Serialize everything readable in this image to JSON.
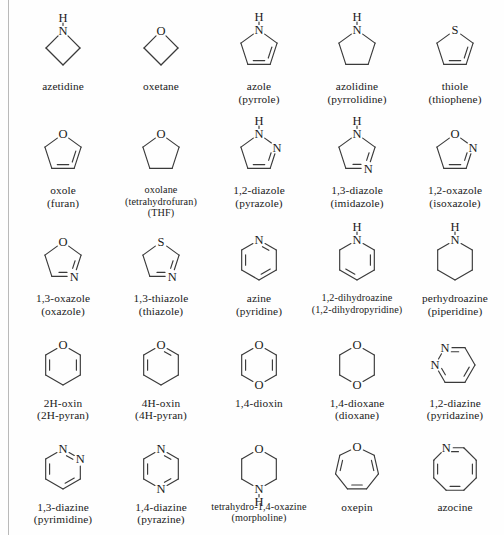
{
  "figure": {
    "type": "chemical-structure-chart",
    "columns": 5,
    "rows": 5,
    "line_color": "#3a3a3a",
    "text_color": "#1a1a1a",
    "background": "#fefefe"
  },
  "compounds": [
    {
      "id": "azetidine",
      "name_main": "azetidine",
      "name_alt": "",
      "name_alt2": "",
      "ring_size": 4,
      "ring_shape": "square-diamond",
      "heteroatoms": [
        {
          "label": "N",
          "position": "top",
          "hydrogen": "H"
        }
      ],
      "double_bonds": 0
    },
    {
      "id": "oxetane",
      "name_main": "oxetane",
      "name_alt": "",
      "name_alt2": "",
      "ring_size": 4,
      "ring_shape": "square-diamond",
      "heteroatoms": [
        {
          "label": "O",
          "position": "top",
          "hydrogen": ""
        }
      ],
      "double_bonds": 0
    },
    {
      "id": "azole",
      "name_main": "azole",
      "name_alt": "(pyrrole)",
      "name_alt2": "",
      "ring_size": 5,
      "ring_shape": "pentagon",
      "heteroatoms": [
        {
          "label": "N",
          "position": "top",
          "hydrogen": "H"
        }
      ],
      "double_bonds": 2
    },
    {
      "id": "azolidine",
      "name_main": "azolidine",
      "name_alt": "(pyrrolidine)",
      "name_alt2": "",
      "ring_size": 5,
      "ring_shape": "pentagon",
      "heteroatoms": [
        {
          "label": "N",
          "position": "top",
          "hydrogen": "H"
        }
      ],
      "double_bonds": 0
    },
    {
      "id": "thiole",
      "name_main": "thiole",
      "name_alt": "(thiophene)",
      "name_alt2": "",
      "ring_size": 5,
      "ring_shape": "pentagon",
      "heteroatoms": [
        {
          "label": "S",
          "position": "top",
          "hydrogen": ""
        }
      ],
      "double_bonds": 2
    },
    {
      "id": "oxole",
      "name_main": "oxole",
      "name_alt": "(furan)",
      "name_alt2": "",
      "ring_size": 5,
      "ring_shape": "pentagon",
      "heteroatoms": [
        {
          "label": "O",
          "position": "top",
          "hydrogen": ""
        }
      ],
      "double_bonds": 2
    },
    {
      "id": "oxolane",
      "name_main": "oxolane",
      "name_alt": "(tetrahydrofuran)",
      "name_alt2": "(THF)",
      "ring_size": 5,
      "ring_shape": "pentagon",
      "heteroatoms": [
        {
          "label": "O",
          "position": "top",
          "hydrogen": ""
        }
      ],
      "double_bonds": 0
    },
    {
      "id": "12-diazole",
      "name_main": "1,2-diazole",
      "name_alt": "(pyrazole)",
      "name_alt2": "",
      "ring_size": 5,
      "ring_shape": "pentagon",
      "heteroatoms": [
        {
          "label": "N",
          "position": "top",
          "hydrogen": "H"
        },
        {
          "label": "N",
          "position": "upper-right",
          "hydrogen": ""
        }
      ],
      "double_bonds": 2
    },
    {
      "id": "13-diazole",
      "name_main": "1,3-diazole",
      "name_alt": "(imidazole)",
      "name_alt2": "",
      "ring_size": 5,
      "ring_shape": "pentagon",
      "heteroatoms": [
        {
          "label": "N",
          "position": "top",
          "hydrogen": "H"
        },
        {
          "label": "N",
          "position": "lower-right",
          "hydrogen": ""
        }
      ],
      "double_bonds": 2
    },
    {
      "id": "12-oxazole",
      "name_main": "1,2-oxazole",
      "name_alt": "(isoxazole)",
      "name_alt2": "",
      "ring_size": 5,
      "ring_shape": "pentagon",
      "heteroatoms": [
        {
          "label": "O",
          "position": "top",
          "hydrogen": ""
        },
        {
          "label": "N",
          "position": "upper-right",
          "hydrogen": ""
        }
      ],
      "double_bonds": 2
    },
    {
      "id": "13-oxazole",
      "name_main": "1,3-oxazole",
      "name_alt": "(oxazole)",
      "name_alt2": "",
      "ring_size": 5,
      "ring_shape": "pentagon",
      "heteroatoms": [
        {
          "label": "O",
          "position": "top",
          "hydrogen": ""
        },
        {
          "label": "N",
          "position": "lower-right",
          "hydrogen": ""
        }
      ],
      "double_bonds": 2
    },
    {
      "id": "13-thiazole",
      "name_main": "1,3-thiazole",
      "name_alt": "(thiazole)",
      "name_alt2": "",
      "ring_size": 5,
      "ring_shape": "pentagon",
      "heteroatoms": [
        {
          "label": "S",
          "position": "top",
          "hydrogen": ""
        },
        {
          "label": "N",
          "position": "lower-right",
          "hydrogen": ""
        }
      ],
      "double_bonds": 2
    },
    {
      "id": "azine",
      "name_main": "azine",
      "name_alt": "(pyridine)",
      "name_alt2": "",
      "ring_size": 6,
      "ring_shape": "hexagon-pointy-top",
      "heteroatoms": [
        {
          "label": "N",
          "position": "top",
          "hydrogen": ""
        }
      ],
      "double_bonds": 3
    },
    {
      "id": "12-dihydroazine",
      "name_main": "1,2-dihydroazine",
      "name_alt": "(1,2-dihydropyridine)",
      "name_alt2": "",
      "ring_size": 6,
      "ring_shape": "hexagon-pointy-top",
      "heteroatoms": [
        {
          "label": "N",
          "position": "top",
          "hydrogen": "H"
        }
      ],
      "double_bonds": 2
    },
    {
      "id": "perhydroazine",
      "name_main": "perhydroazine",
      "name_alt": "(piperidine)",
      "name_alt2": "",
      "ring_size": 6,
      "ring_shape": "hexagon-pointy-top",
      "heteroatoms": [
        {
          "label": "N",
          "position": "top",
          "hydrogen": "H"
        }
      ],
      "double_bonds": 0
    },
    {
      "id": "2h-oxin",
      "name_main": "2H-oxin",
      "name_alt": "(2H-pyran)",
      "name_alt2": "",
      "ring_size": 6,
      "ring_shape": "hexagon-pointy-top",
      "heteroatoms": [
        {
          "label": "O",
          "position": "top",
          "hydrogen": ""
        }
      ],
      "double_bonds": 2
    },
    {
      "id": "4h-oxin",
      "name_main": "4H-oxin",
      "name_alt": "(4H-pyran)",
      "name_alt2": "",
      "ring_size": 6,
      "ring_shape": "hexagon-pointy-top",
      "heteroatoms": [
        {
          "label": "O",
          "position": "top",
          "hydrogen": ""
        }
      ],
      "double_bonds": 2
    },
    {
      "id": "14-dioxin",
      "name_main": "1,4-dioxin",
      "name_alt": "",
      "name_alt2": "",
      "ring_size": 6,
      "ring_shape": "hexagon-pointy-top",
      "heteroatoms": [
        {
          "label": "O",
          "position": "top",
          "hydrogen": ""
        },
        {
          "label": "O",
          "position": "bottom",
          "hydrogen": ""
        }
      ],
      "double_bonds": 2
    },
    {
      "id": "14-dioxane",
      "name_main": "1,4-dioxane",
      "name_alt": "(dioxane)",
      "name_alt2": "",
      "ring_size": 6,
      "ring_shape": "hexagon-pointy-top",
      "heteroatoms": [
        {
          "label": "O",
          "position": "top",
          "hydrogen": ""
        },
        {
          "label": "O",
          "position": "bottom",
          "hydrogen": ""
        }
      ],
      "double_bonds": 0
    },
    {
      "id": "12-diazine",
      "name_main": "1,2-diazine",
      "name_alt": "(pyridazine)",
      "name_alt2": "",
      "ring_size": 6,
      "ring_shape": "hexagon-flat-top",
      "heteroatoms": [
        {
          "label": "N",
          "position": "top-left",
          "hydrogen": ""
        },
        {
          "label": "N",
          "position": "top-right",
          "hydrogen": ""
        }
      ],
      "double_bonds": 3
    },
    {
      "id": "13-diazine",
      "name_main": "1,3-diazine",
      "name_alt": "(pyrimidine)",
      "name_alt2": "",
      "ring_size": 6,
      "ring_shape": "hexagon-pointy-top",
      "heteroatoms": [
        {
          "label": "N",
          "position": "top",
          "hydrogen": ""
        },
        {
          "label": "N",
          "position": "upper-right",
          "hydrogen": ""
        }
      ],
      "double_bonds": 3
    },
    {
      "id": "14-diazine",
      "name_main": "1,4-diazine",
      "name_alt": "(pyrazine)",
      "name_alt2": "",
      "ring_size": 6,
      "ring_shape": "hexagon-pointy-top",
      "heteroatoms": [
        {
          "label": "N",
          "position": "top",
          "hydrogen": ""
        },
        {
          "label": "N",
          "position": "bottom",
          "hydrogen": ""
        }
      ],
      "double_bonds": 3
    },
    {
      "id": "tetrahydro-14-oxazine",
      "name_main": "tetrahydro-1,4-oxazine",
      "name_alt": "(morpholine)",
      "name_alt2": "",
      "ring_size": 6,
      "ring_shape": "hexagon-pointy-top",
      "heteroatoms": [
        {
          "label": "O",
          "position": "top",
          "hydrogen": ""
        },
        {
          "label": "N",
          "position": "bottom",
          "hydrogen": "H"
        }
      ],
      "double_bonds": 0
    },
    {
      "id": "oxepin",
      "name_main": "oxepin",
      "name_alt": "",
      "name_alt2": "",
      "ring_size": 7,
      "ring_shape": "heptagon",
      "heteroatoms": [
        {
          "label": "O",
          "position": "top",
          "hydrogen": ""
        }
      ],
      "double_bonds": 3
    },
    {
      "id": "azocine",
      "name_main": "azocine",
      "name_alt": "",
      "name_alt2": "",
      "ring_size": 8,
      "ring_shape": "octagon",
      "heteroatoms": [
        {
          "label": "N",
          "position": "top",
          "hydrogen": ""
        }
      ],
      "double_bonds": 4
    }
  ]
}
